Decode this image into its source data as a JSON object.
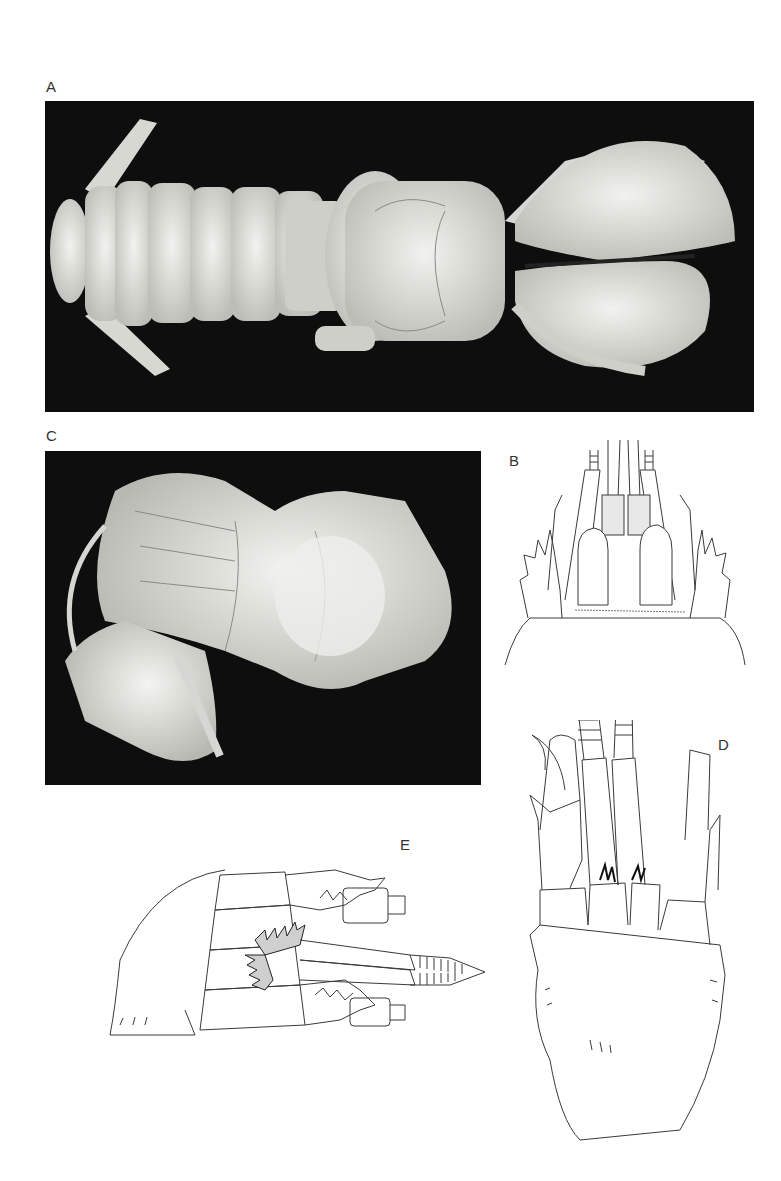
{
  "figure": {
    "panels": [
      {
        "id": "A",
        "label": "A",
        "type": "photograph",
        "subject": "dorsal view, whole specimen"
      },
      {
        "id": "B",
        "label": "B",
        "type": "line-drawing",
        "subject": "anterior carapace, antennal region"
      },
      {
        "id": "C",
        "label": "C",
        "type": "photograph",
        "subject": "lateral view, specimen"
      },
      {
        "id": "D",
        "label": "D",
        "type": "line-drawing",
        "subject": "cephalothorax with antennae, dorsal"
      },
      {
        "id": "E",
        "label": "E",
        "type": "line-drawing",
        "subject": "chelipeds and mouthparts, lateral"
      }
    ]
  },
  "colors": {
    "photo_background": "#0e0e0e",
    "specimen": "#e6e6e2",
    "line": "#3a3a3a",
    "label": "#333333"
  }
}
